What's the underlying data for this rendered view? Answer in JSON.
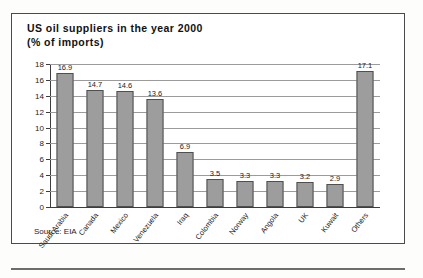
{
  "figure": {
    "title_line1": "US oil suppliers in the year 2000",
    "title_line2": "(% of imports)",
    "source": "Source: EIA"
  },
  "chart_data": {
    "type": "bar",
    "title": "US oil suppliers in the year 2000 (% of imports)",
    "xlabel": "",
    "ylabel": "",
    "ylim": [
      0,
      18
    ],
    "yticks": [
      0,
      2,
      4,
      6,
      8,
      10,
      12,
      14,
      16,
      18
    ],
    "grid": true,
    "legend": false,
    "bar_color": "#9d9d9d",
    "bar_edge_color": "#4f4f4f",
    "categories": [
      "Saudi Arabia",
      "Canada",
      "Mexico",
      "Venezuela",
      "Iraq",
      "Colombia",
      "Norway",
      "Angola",
      "UK",
      "Kuwait",
      "Others"
    ],
    "values": [
      16.9,
      14.7,
      14.6,
      13.6,
      6.9,
      3.5,
      3.3,
      3.3,
      3.2,
      2.9,
      17.1
    ],
    "value_labels": [
      "16.9",
      "14.7",
      "14.6",
      "13.6",
      "6.9",
      "3.5",
      "3.3",
      "3.3",
      "3.2",
      "2.9",
      "17.1"
    ]
  }
}
